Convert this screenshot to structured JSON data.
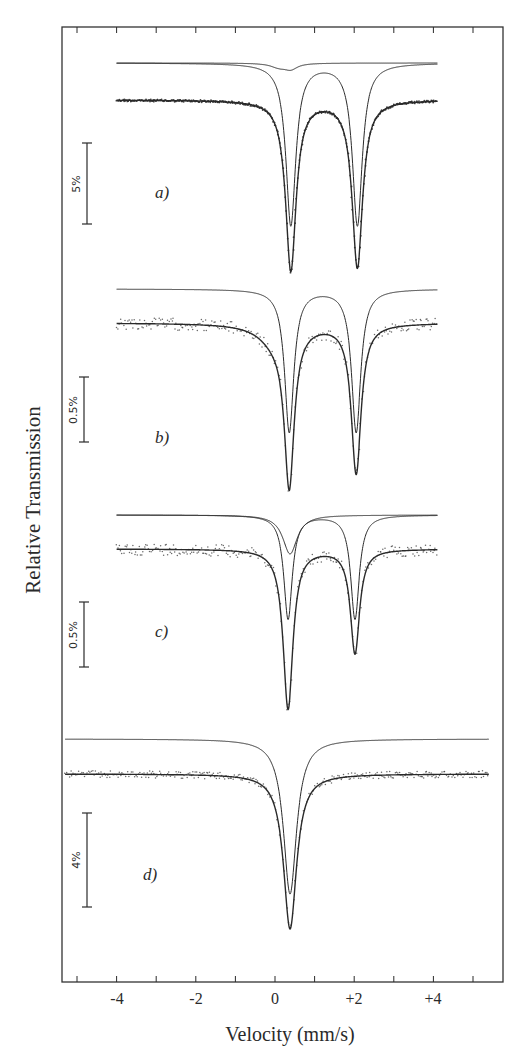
{
  "chart_data": {
    "type": "line",
    "title": "",
    "xlabel": "Velocity (mm/s)",
    "ylabel": "Relative Transmission",
    "x_ticks": [
      "-4",
      "-2",
      "0",
      "+2",
      "+4"
    ],
    "x_tick_values": [
      -4,
      -2,
      0,
      2,
      4
    ],
    "xlim": [
      -5.5,
      5.8
    ],
    "grid": false,
    "legend": null,
    "panels": [
      {
        "label": "a)",
        "scale_bar": "5%",
        "x_range": [
          -4,
          4.1
        ],
        "data_baseline_px": 100,
        "sub_baseline_px": 63,
        "scale_bar_px": [
          143,
          224
        ],
        "data_fit": {
          "peaks": [
            {
              "pos": 0.4,
              "depth_pct": 10.5,
              "hwhm": 0.16
            },
            {
              "pos": 2.08,
              "depth_pct": 10.3,
              "hwhm": 0.16
            }
          ]
        },
        "subspectra": [
          {
            "peaks": [
              {
                "pos": 0.4,
                "depth_pct": 10.0,
                "hwhm": 0.15
              },
              {
                "pos": 2.08,
                "depth_pct": 10.0,
                "hwhm": 0.15
              }
            ]
          },
          {
            "peaks": [
              {
                "pos": 0.1,
                "depth_pct": 0.25,
                "hwhm": 0.25
              },
              {
                "pos": 0.4,
                "depth_pct": 0.35,
                "hwhm": 0.2
              }
            ]
          }
        ],
        "noise": "low"
      },
      {
        "label": "b)",
        "scale_bar": "0.5%",
        "x_range": [
          -4,
          4.1
        ],
        "data_baseline_px": 323,
        "sub_baseline_px": 289,
        "scale_bar_px": [
          377,
          442
        ],
        "data_fit": {
          "peaks": [
            {
              "pos": 0.36,
              "depth_pct": 1.2,
              "hwhm": 0.15
            },
            {
              "pos": 2.05,
              "depth_pct": 1.15,
              "hwhm": 0.15
            },
            {
              "pos": 0.0,
              "depth_pct": 0.12,
              "hwhm": 0.5
            }
          ]
        },
        "subspectra": [
          {
            "peaks": [
              {
                "pos": 0.36,
                "depth_pct": 1.1,
                "hwhm": 0.14
              },
              {
                "pos": 2.05,
                "depth_pct": 1.1,
                "hwhm": 0.14
              }
            ]
          }
        ],
        "noise": "high"
      },
      {
        "label": "c)",
        "scale_bar": "0.5%",
        "x_range": [
          -4,
          4.1
        ],
        "data_baseline_px": 549,
        "sub_baseline_px": 515,
        "scale_bar_px": [
          602,
          667
        ],
        "data_fit": {
          "peaks": [
            {
              "pos": 0.33,
              "depth_pct": 1.23,
              "hwhm": 0.15
            },
            {
              "pos": 2.02,
              "depth_pct": 0.8,
              "hwhm": 0.14
            }
          ]
        },
        "subspectra": [
          {
            "peaks": [
              {
                "pos": 0.38,
                "depth_pct": 0.3,
                "hwhm": 0.22
              }
            ]
          },
          {
            "peaks": [
              {
                "pos": 0.33,
                "depth_pct": 0.8,
                "hwhm": 0.13
              },
              {
                "pos": 2.02,
                "depth_pct": 0.8,
                "hwhm": 0.13
              }
            ]
          }
        ],
        "noise": "high"
      },
      {
        "label": "d)",
        "scale_bar": "4%",
        "x_range": [
          -5.3,
          5.4
        ],
        "data_baseline_px": 774,
        "sub_baseline_px": 739,
        "scale_bar_px": [
          813,
          907
        ],
        "data_fit": {
          "peaks": [
            {
              "pos": 0.38,
              "depth_pct": 6.6,
              "hwhm": 0.2
            }
          ]
        },
        "subspectra": [
          {
            "peaks": [
              {
                "pos": 0.38,
                "depth_pct": 6.6,
                "hwhm": 0.2
              }
            ]
          }
        ],
        "noise": "medium"
      }
    ]
  },
  "axes": {
    "x_label": "Velocity (mm/s)",
    "y_label": "Relative Transmission",
    "ticks": [
      {
        "label": "-4",
        "value": -4
      },
      {
        "label": "-2",
        "value": -2
      },
      {
        "label": "0",
        "value": 0
      },
      {
        "label": "+2",
        "value": 2
      },
      {
        "label": "+4",
        "value": 4
      }
    ]
  },
  "panels": [
    {
      "label": "a)",
      "scale": "5%"
    },
    {
      "label": "b)",
      "scale": "0.5%"
    },
    {
      "label": "c)",
      "scale": "0.5%"
    },
    {
      "label": "d)",
      "scale": "4%"
    }
  ],
  "colors": {
    "ink": "#2a2a2a",
    "background": "#ffffff"
  }
}
